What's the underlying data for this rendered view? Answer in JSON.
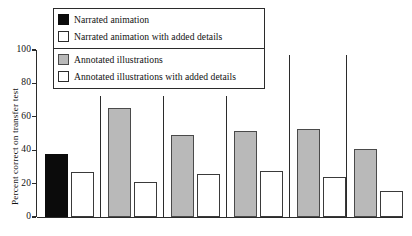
{
  "chart_data": {
    "type": "bar",
    "title": "",
    "subtitle": "",
    "xlabel": "",
    "ylabel": "Percent correct on transfer test",
    "ylim": [
      0,
      100
    ],
    "yticks": [
      0,
      20,
      40,
      60,
      80,
      100
    ],
    "ytick_labels": [
      "0",
      "20",
      "40",
      "60",
      "80",
      "100"
    ],
    "grid": false,
    "legend_position": "top-left",
    "categories": [
      "Group 1",
      "Group 2",
      "Group 3",
      "Group 4",
      "Group 5",
      "Group 6"
    ],
    "series": [
      {
        "name": "Narrated animation",
        "swatch": "black",
        "color": "#0b0b0b",
        "values": [
          38,
          null,
          null,
          null,
          null,
          null
        ]
      },
      {
        "name": "Narrated animation with added details",
        "swatch": "white",
        "color": "#ffffff",
        "values": [
          27,
          null,
          null,
          null,
          null,
          null
        ]
      },
      {
        "name": "Annotated illustrations",
        "swatch": "gray",
        "color": "#b9b9b9",
        "values": [
          null,
          65,
          49,
          51.5,
          53,
          41
        ]
      },
      {
        "name": "Annotated illustrations with added details",
        "swatch": "white",
        "color": "#ffffff",
        "values": [
          null,
          21,
          26,
          27.5,
          24,
          15.5
        ]
      }
    ],
    "bars": [
      {
        "group": 1,
        "fill": "black",
        "value": 38
      },
      {
        "group": 1,
        "fill": "white",
        "value": 27
      },
      {
        "group": 2,
        "fill": "gray",
        "value": 65
      },
      {
        "group": 2,
        "fill": "white",
        "value": 21
      },
      {
        "group": 3,
        "fill": "gray",
        "value": 49
      },
      {
        "group": 3,
        "fill": "white",
        "value": 26
      },
      {
        "group": 4,
        "fill": "gray",
        "value": 51.5
      },
      {
        "group": 4,
        "fill": "white",
        "value": 27.5
      },
      {
        "group": 5,
        "fill": "gray",
        "value": 53
      },
      {
        "group": 5,
        "fill": "white",
        "value": 24
      },
      {
        "group": 6,
        "fill": "gray",
        "value": 41
      },
      {
        "group": 6,
        "fill": "white",
        "value": 15.5
      }
    ]
  },
  "axis": {
    "y_title": "Percent correct on transfer test",
    "ticks": [
      {
        "label": "100",
        "value": 100
      },
      {
        "label": "80",
        "value": 80
      },
      {
        "label": "60",
        "value": 60
      },
      {
        "label": "40",
        "value": 40
      },
      {
        "label": "20",
        "value": 20
      },
      {
        "label": "0",
        "value": 0
      }
    ]
  },
  "legend": {
    "groups": [
      {
        "entries": [
          {
            "swatch": "black",
            "label": "Narrated animation"
          },
          {
            "swatch": "white",
            "label": "Narrated animation with added details"
          }
        ]
      },
      {
        "entries": [
          {
            "swatch": "gray",
            "label": "Annotated illustrations"
          },
          {
            "swatch": "white",
            "label": "Annotated illustrations with added details"
          }
        ]
      }
    ]
  },
  "colors": {
    "black_series": "#0b0b0b",
    "gray_series": "#b9b9b9",
    "white_series": "#ffffff",
    "axis": "#2b2b2b",
    "background": "#ffffff"
  }
}
